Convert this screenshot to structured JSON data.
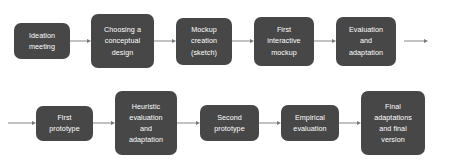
{
  "diagram": {
    "background_color": "#ffffff",
    "node_color": "#474747",
    "node_text_color": "#ffffff",
    "arrow_color": "#888888",
    "rows": [
      {
        "name": "row-1",
        "leading_arrow": false,
        "trailing_arrow": true,
        "nodes": [
          {
            "id": "ideation-meeting",
            "lines": [
              "Ideation",
              "meeting"
            ],
            "text": "Ideation meeting"
          },
          {
            "id": "choosing-conceptual-design",
            "lines": [
              "Choosing a",
              "conceptual",
              "design"
            ],
            "text": "Choosing a conceptual design"
          },
          {
            "id": "mockup-creation-sketch",
            "lines": [
              "Mockup",
              "creation",
              "(sketch)"
            ],
            "text": "Mockup creation (sketch)"
          },
          {
            "id": "first-interactive-mockup",
            "lines": [
              "First",
              "interactive",
              "mockup"
            ],
            "text": "First interactive mockup"
          },
          {
            "id": "evaluation-and-adaptation",
            "lines": [
              "Evaluation",
              "and",
              "adaptation"
            ],
            "text": "Evaluation and adaptation"
          }
        ]
      },
      {
        "name": "row-2",
        "leading_arrow": true,
        "trailing_arrow": false,
        "nodes": [
          {
            "id": "first-prototype",
            "lines": [
              "First",
              "prototype"
            ],
            "text": "First prototype"
          },
          {
            "id": "heuristic-evaluation-and-adaptation",
            "lines": [
              "Heuristic",
              "evaluation",
              "and",
              "adaptation"
            ],
            "text": "Heuristic evaluation and adaptation"
          },
          {
            "id": "second-prototype",
            "lines": [
              "Second",
              "prototype"
            ],
            "text": "Second prototype"
          },
          {
            "id": "empirical-evaluation",
            "lines": [
              "Empirical",
              "evaluation"
            ],
            "text": "Empirical evaluation"
          },
          {
            "id": "final-adaptations-and-final-version",
            "lines": [
              "Final",
              "adaptations",
              "and final",
              "version"
            ],
            "text": "Final adaptations and final version"
          }
        ]
      }
    ]
  }
}
